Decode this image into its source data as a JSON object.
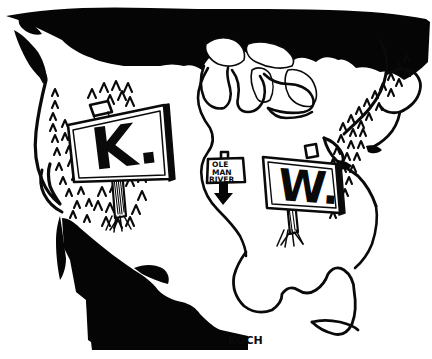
{
  "artwork": {
    "title": "Broadcast Call-Letter Map Cartoon",
    "medium": "pen-and-ink cartoon",
    "signature": "KOCH",
    "background_color": "#ffffff",
    "ink_color": "#0a0a0a"
  },
  "map": {
    "subject": "United States",
    "regions": {
      "canada_label": "Canada (solid black)",
      "mexico_label": "Mexico (solid black)",
      "usa_label": "United States (white)",
      "great_lakes_label": "Great Lakes"
    }
  },
  "signs": {
    "west": {
      "letter": "K.",
      "name": "west-call-sign"
    },
    "east": {
      "letter": "W.",
      "name": "east-call-sign"
    },
    "river": {
      "line1": "OLE",
      "line2": "MAN",
      "line3": "RIVER",
      "name": "mississippi-river-sign"
    }
  },
  "decor": {
    "mountains_west": "Rocky Mountain chevrons",
    "mountains_east": "Appalachian Mountain chevrons",
    "grass": "grass tufts at sign posts",
    "arrow": "downward arrow pointing to river"
  }
}
